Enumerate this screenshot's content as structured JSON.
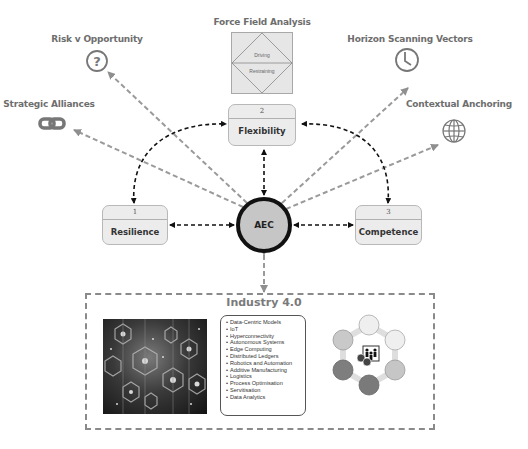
{
  "diagram": {
    "center": {
      "label": "AEC"
    },
    "core_nodes": [
      {
        "number": "1",
        "label": "Resilience"
      },
      {
        "number": "2",
        "label": "Flexibility"
      },
      {
        "number": "3",
        "label": "Competence"
      }
    ],
    "outer_nodes": [
      {
        "label": "Strategic Alliances",
        "icon": "chain-link-icon"
      },
      {
        "label": "Risk v Opportunity",
        "icon": "question-circle-icon"
      },
      {
        "label": "Force Field Analysis",
        "icon": "force-field-diagram"
      },
      {
        "label": "Horizon Scanning Vectors",
        "icon": "clock-icon"
      },
      {
        "label": "Contextual Anchoring",
        "icon": "globe-icon"
      }
    ],
    "force_field": {
      "driving": "Driving",
      "restraining": "Restraining"
    },
    "industry": {
      "title": "Industry 4.0",
      "items": [
        "Data-Centric Models",
        "IoT",
        "Hyperconnectivity",
        "Autonomous Systems",
        "Edge Computing",
        "Distributed Ledgers",
        "Robotics and Automation",
        "Additive Manufacturing",
        "Logistics",
        "Process Optimisation",
        "Servitisation",
        "Data Analytics"
      ],
      "image": "hexagon-network-image",
      "cycle_graphic": "people-globe-cycle-icon"
    },
    "colors": {
      "core_arrow": "#111111",
      "outer_arrow": "#9a9a9a",
      "box_fill": "#ececec",
      "center_fill": "#c6c6c6"
    }
  }
}
